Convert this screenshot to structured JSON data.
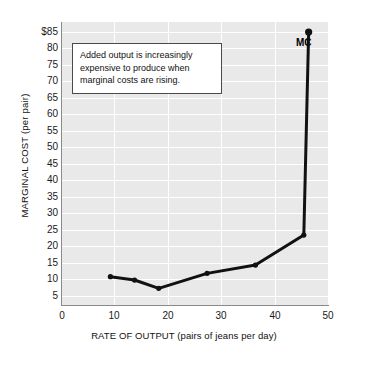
{
  "chart_data": {
    "type": "line",
    "title": "",
    "xlabel": "RATE OF OUTPUT (pairs of jeans per day)",
    "ylabel": "MARGINAL COST (per pair)",
    "series_name": "MC",
    "x": [
      10,
      15,
      20,
      30,
      40,
      50,
      51
    ],
    "values": [
      8.5,
      7.5,
      5,
      9.5,
      12,
      21,
      82
    ],
    "xlim": [
      0,
      55
    ],
    "ylim": [
      0,
      85
    ],
    "xticks": [
      "0",
      "10",
      "20",
      "30",
      "40",
      "50"
    ],
    "xtick_values": [
      0,
      10,
      20,
      30,
      40,
      50
    ],
    "yticks": [
      "$85",
      "80",
      "75",
      "70",
      "65",
      "60",
      "55",
      "50",
      "45",
      "40",
      "35",
      "30",
      "25",
      "20",
      "15",
      "10",
      "5"
    ],
    "ytick_values": [
      85,
      80,
      75,
      70,
      65,
      60,
      55,
      50,
      45,
      40,
      35,
      30,
      25,
      20,
      15,
      10,
      5
    ],
    "y_origin_label": "0",
    "grid": true,
    "legend": "none",
    "annotations": [
      {
        "name": "marginal-cost-note",
        "lines": [
          "Added output is increasingly",
          "expensive to produce when",
          "marginal costs are rising."
        ]
      }
    ],
    "colors": {
      "plot_background": "#e9e9e9",
      "gridline": "#ffffff",
      "curve": "#111111",
      "axis": "#8a8a8a",
      "text": "#111111",
      "annotation_background": "#ffffff",
      "annotation_border": "#4a4a4a"
    }
  }
}
